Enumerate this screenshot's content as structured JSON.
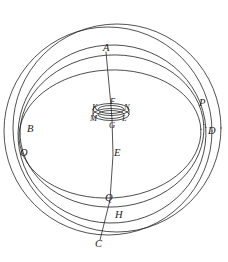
{
  "figure": {
    "background_color": "#ffffff",
    "stroke_color": "#262626",
    "label_color": "#1a1a1a",
    "width": 228,
    "height": 262
  },
  "curves": [
    {
      "name": "outer-circle-left",
      "kind": "circle",
      "cx": 108,
      "cy": 131,
      "r": 104,
      "rotation": 0
    },
    {
      "name": "outer-circle-right",
      "kind": "circle",
      "cx": 117,
      "cy": 128,
      "r": 104,
      "rotation": 0
    },
    {
      "name": "meridian-ellipse",
      "kind": "ellipse",
      "cx": 112,
      "cy": 134,
      "rx": 94,
      "ry": 89,
      "rotation": -4
    },
    {
      "name": "horizon-ellipse",
      "kind": "ellipse",
      "cx": 112,
      "cy": 131,
      "rx": 92,
      "ry": 76,
      "rotation": -4
    },
    {
      "name": "equator-ellipse",
      "kind": "ellipse",
      "cx": 110,
      "cy": 134,
      "rx": 91,
      "ry": 64,
      "rotation": -3
    }
  ],
  "axis": {
    "name": "polar-axis",
    "points": [
      {
        "label": "A",
        "x": 106,
        "y": 52
      },
      {
        "label": "F",
        "x": 111,
        "y": 106
      },
      {
        "label": "G",
        "x": 112,
        "y": 119
      },
      {
        "label": "E",
        "x": 113,
        "y": 155
      },
      {
        "label": "Q",
        "x": 110,
        "y": 200
      },
      {
        "label": "C",
        "x": 100,
        "y": 240
      }
    ]
  },
  "inner_ring": {
    "name": "central-ring",
    "cx": 111,
    "cy": 112,
    "outer_rx": 18,
    "outer_ry": 6,
    "inner_rx": 13,
    "inner_ry": 4,
    "band_offset": 5
  },
  "labels": [
    {
      "id": "A",
      "text": "A",
      "x": 103,
      "y": 43,
      "size": "major"
    },
    {
      "id": "B",
      "text": "B",
      "x": 27,
      "y": 124,
      "size": "major"
    },
    {
      "id": "O",
      "text": "O",
      "x": 20,
      "y": 148,
      "size": "major"
    },
    {
      "id": "C",
      "text": "C",
      "x": 95,
      "y": 239,
      "size": "major"
    },
    {
      "id": "D",
      "text": "D",
      "x": 208,
      "y": 126,
      "size": "major"
    },
    {
      "id": "P",
      "text": "P",
      "x": 199,
      "y": 98,
      "size": "major"
    },
    {
      "id": "E",
      "text": "E",
      "x": 114,
      "y": 148,
      "size": "major"
    },
    {
      "id": "Q",
      "text": "Q",
      "x": 105,
      "y": 193,
      "size": "major"
    },
    {
      "id": "H",
      "text": "H",
      "x": 115,
      "y": 210,
      "size": "major"
    },
    {
      "id": "K",
      "text": "K",
      "x": 92,
      "y": 103,
      "size": "minor"
    },
    {
      "id": "F",
      "text": "F",
      "x": 110,
      "y": 97,
      "size": "minor"
    },
    {
      "id": "N",
      "text": "N",
      "x": 124,
      "y": 103,
      "size": "minor"
    },
    {
      "id": "M",
      "text": "M",
      "x": 90,
      "y": 114,
      "size": "minor"
    },
    {
      "id": "L",
      "text": "L",
      "x": 122,
      "y": 114,
      "size": "minor"
    },
    {
      "id": "G",
      "text": "G",
      "x": 109,
      "y": 121,
      "size": "minor"
    }
  ]
}
